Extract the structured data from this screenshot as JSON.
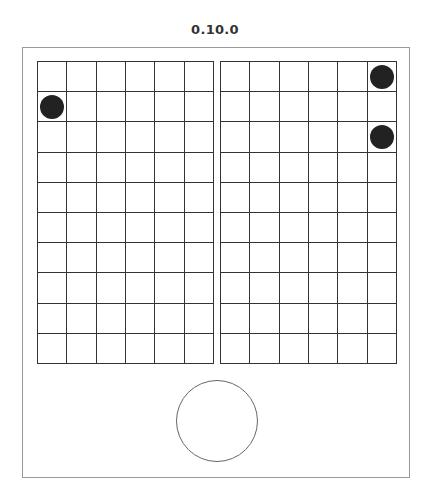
{
  "title": "0.10.0",
  "boards": [
    {
      "name": "left",
      "rows": 10,
      "cols": 6,
      "dots": [
        {
          "row": 1,
          "col": 0
        }
      ]
    },
    {
      "name": "right",
      "rows": 10,
      "cols": 6,
      "dots": [
        {
          "row": 0,
          "col": 5
        },
        {
          "row": 2,
          "col": 5
        }
      ]
    }
  ],
  "colors": {
    "dot": "#222222",
    "grid_line": "#333333",
    "frame_border": "#9a9a9a",
    "button_border": "#666666"
  },
  "button": {
    "shape": "circle",
    "label": ""
  }
}
